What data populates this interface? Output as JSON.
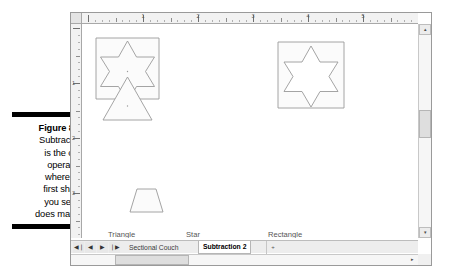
{
  "figure": {
    "label": "Figure 8-3:",
    "lines": [
      "Subtraction",
      "is the only",
      "operation",
      "where the",
      "first shape",
      "you select",
      "does matter."
    ]
  },
  "window": {
    "rulers": {
      "horizontal_numbers": [
        "1",
        "2",
        "3",
        "4",
        "5",
        "6"
      ],
      "vertical_numbers": [
        "1",
        "2",
        "3"
      ],
      "units": "inches"
    },
    "canvas": {
      "shape_labels": [
        {
          "text": "Triangle",
          "x": 26,
          "y": 209
        },
        {
          "text": "Star",
          "x": 103,
          "y": 209
        },
        {
          "text": "Rectangle",
          "x": 185,
          "y": 209
        }
      ],
      "shapes": [
        {
          "name": "rectangle-with-star-overlay",
          "kind": "rectangle"
        },
        {
          "name": "six-point-star-source",
          "kind": "star"
        },
        {
          "name": "triangle-source",
          "kind": "triangle"
        },
        {
          "name": "trapezoid-result",
          "kind": "trapezoid"
        },
        {
          "name": "rectangle-minus-star-result",
          "kind": "compound"
        }
      ]
    },
    "scrollbars": {
      "up_arrow": "▴",
      "down_arrow": "▾",
      "right_arrow": "▸"
    }
  },
  "tabbar": {
    "nav": [
      {
        "name": "first-sheet",
        "glyph": "◀❘"
      },
      {
        "name": "previous-sheet",
        "glyph": "◀"
      },
      {
        "name": "next-sheet",
        "glyph": "▶"
      },
      {
        "name": "last-sheet",
        "glyph": "❘▶"
      }
    ],
    "tabs": [
      {
        "label": "Sectional Couch",
        "active": false
      },
      {
        "label": "Subtraction 2",
        "active": true
      }
    ],
    "add_label": "+"
  },
  "colors": {
    "shape_stroke": "#9a9a9a",
    "shape_fill": "#fbfbfb",
    "window_border": "#9a9a9a",
    "ruler_bg": "#f2f2f2"
  }
}
